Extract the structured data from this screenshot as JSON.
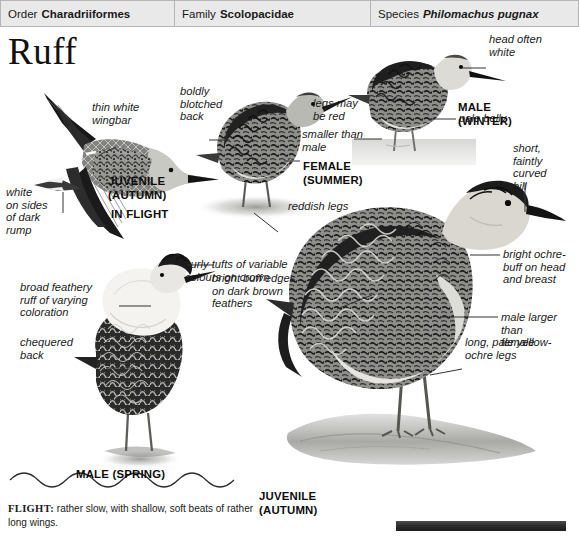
{
  "header": {
    "columns": [
      {
        "key": "Order",
        "value": "Charadriiformes",
        "italic": false
      },
      {
        "key": "Family",
        "value": "Scolopacidae",
        "italic": false
      },
      {
        "key": "Species",
        "value": "Philomachus pugnax",
        "italic": true
      }
    ]
  },
  "page": {
    "title": "Ruff"
  },
  "labels": {
    "thin_white_wingbar": "thin white\nwingbar",
    "white_sides_dark_rump": "white\non sides\nof dark\nrump",
    "boldly_blotched_back": "boldly\nblotched\nback",
    "legs_may_be_red": "legs may\nbe red",
    "smaller_than_male": "smaller than\nmale",
    "reddish_legs": "reddish legs",
    "head_often_white": "head often\nwhite",
    "pale_belly": "pale belly",
    "short_faintly_curved_bill": "short,\nfaintly\ncurved\nbill",
    "bright_ochre_buff": "bright ochre-\nbuff on head\nand breast",
    "male_larger_than_female": "male larger than\nfemale",
    "long_pale_yellow_ochre_legs": "long, pale yellow-\nochre legs",
    "curly_tufts": "curly tufts of variable\ncolours on crown",
    "bright_buff_edges": "bright buff edges\non dark brown\nfeathers",
    "broad_feathery_ruff": "broad feathery\nruff of varying\ncoloration",
    "chequered_back": "chequered\nback"
  },
  "captions": {
    "juvenile_autumn_flight": "JUVENILE\n(AUTUMN)",
    "in_flight": "IN FLIGHT",
    "female_summer": "FEMALE\n(SUMMER)",
    "male_winter": "MALE\n(WINTER)",
    "male_spring": "MALE (SPRING)",
    "juvenile_autumn": "JUVENILE\n(AUTUMN)"
  },
  "flight_note": {
    "label": "FLIGHT:",
    "text": " rather slow, with shallow, soft beats of rather long wings."
  },
  "colors": {
    "header_bg": "#e9e9e9",
    "header_border": "#b6b6b6",
    "text": "#1a1a1a",
    "leader_line": "#333333",
    "bar": "#2e2e2e"
  }
}
